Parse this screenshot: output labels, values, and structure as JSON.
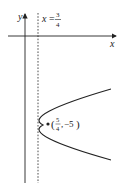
{
  "diagram": {
    "type": "parabola-graph",
    "axes": {
      "x_label": "x",
      "y_label": "y"
    },
    "directrix": {
      "label_var": "x",
      "label_eq": "=",
      "numerator": "3",
      "denominator": "4",
      "style": "dashed"
    },
    "focus_point": {
      "open_paren": "(",
      "x_numerator": "5",
      "x_denominator": "4",
      "comma": ",",
      "y_value": "−5",
      "close_paren": ")"
    },
    "colors": {
      "stroke": "#222222",
      "background": "#ffffff"
    }
  }
}
